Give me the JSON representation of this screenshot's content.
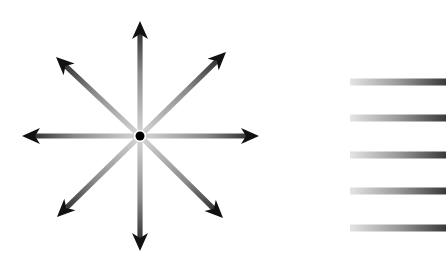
{
  "diagram": {
    "burst": {
      "center": {
        "x": 140,
        "y": 136
      },
      "center_dot_radius": 4.5,
      "center_color": "#000000",
      "arrows": [
        {
          "name": "up",
          "tip": {
            "x": 140,
            "y": 21
          }
        },
        {
          "name": "up-right",
          "tip": {
            "x": 226,
            "y": 52
          }
        },
        {
          "name": "right",
          "tip": {
            "x": 259,
            "y": 136
          }
        },
        {
          "name": "down-right",
          "tip": {
            "x": 223,
            "y": 218
          }
        },
        {
          "name": "down",
          "tip": {
            "x": 140,
            "y": 251
          }
        },
        {
          "name": "down-left",
          "tip": {
            "x": 57,
            "y": 217
          }
        },
        {
          "name": "left",
          "tip": {
            "x": 22,
            "y": 136
          }
        },
        {
          "name": "up-left",
          "tip": {
            "x": 56,
            "y": 57
          }
        }
      ],
      "gradient": {
        "near_center": "#d8d8d8",
        "near_tip": "#1a1a1a"
      }
    },
    "bars": {
      "x_start": 350,
      "x_end": 446,
      "height": 7,
      "y_centers": [
        82,
        118,
        155,
        191,
        228
      ],
      "gradient": {
        "left": "#e4e4e4",
        "right": "#3a3a3a"
      }
    }
  }
}
